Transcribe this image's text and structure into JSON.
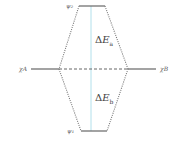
{
  "diagram": {
    "type": "molecular-orbital-energy-diagram",
    "orbitals": {
      "psi2": {
        "label": "ψ₂",
        "level": "antibonding"
      },
      "psi1": {
        "label": "ψ₁",
        "level": "bonding"
      },
      "chiA": {
        "label": "χA"
      },
      "chiB": {
        "label": "χB"
      }
    },
    "energy_gaps": {
      "upper": {
        "delta": "Δ",
        "symbol": "E",
        "subscript": "a"
      },
      "lower": {
        "delta": "Δ",
        "symbol": "E",
        "subscript": "b"
      }
    },
    "colors": {
      "level_line": "#666666",
      "dotted": "#777777",
      "vertical": "#9fd8e6"
    }
  }
}
